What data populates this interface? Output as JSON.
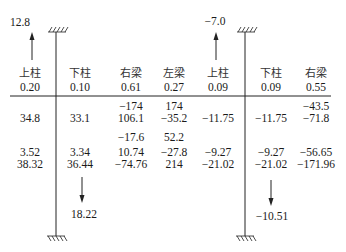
{
  "diagram": {
    "type": "moment-distribution-table",
    "columns": [
      {
        "label": "上柱",
        "factor": "0.20",
        "x": 30
      },
      {
        "label": "下柱",
        "factor": "0.10",
        "x": 80
      },
      {
        "label": "右梁",
        "factor": "0.61",
        "x": 131
      },
      {
        "label": "左梁",
        "factor": "0.27",
        "x": 174
      },
      {
        "label": "上柱",
        "factor": "0.09",
        "x": 218
      },
      {
        "label": "下柱",
        "factor": "0.09",
        "x": 271
      },
      {
        "label": "右梁",
        "factor": "0.55",
        "x": 316
      }
    ],
    "rows": [
      {
        "y": 106,
        "cells": [
          "",
          "",
          "-174",
          "174",
          "",
          "",
          "-43.5"
        ]
      },
      {
        "y": 118,
        "cells": [
          "34.8",
          "33.1",
          "106.1",
          "-35.2",
          "-11.75",
          "-11.75",
          "-71.8"
        ]
      },
      {
        "y": 137,
        "cells": [
          "",
          "",
          "-17.6",
          "52.2",
          "",
          "",
          ""
        ]
      },
      {
        "y": 152,
        "cells": [
          "3.52",
          "3.34",
          "10.74",
          "-27.8",
          "-9.27",
          "-9.27",
          "-56.65"
        ]
      },
      {
        "y": 164,
        "cells": [
          "38.32",
          "36.44",
          "-74.76",
          "214",
          "-21.02",
          "-21.02",
          "-171.96"
        ]
      }
    ],
    "forces": {
      "left_top": "12.8",
      "right_top": "-7.0",
      "left_bottom": "18.22",
      "right_bottom": "-10.51"
    }
  }
}
